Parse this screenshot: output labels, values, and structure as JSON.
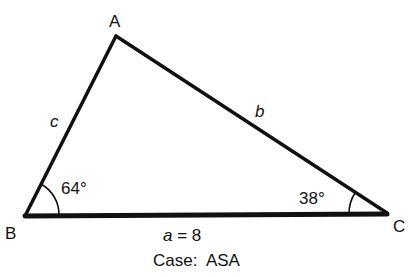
{
  "diagram": {
    "type": "triangle",
    "vertices": {
      "A": {
        "label": "A"
      },
      "B": {
        "label": "B"
      },
      "C": {
        "label": "C"
      }
    },
    "sides": {
      "a": {
        "label": "a = 8",
        "var": "a",
        "value": "8"
      },
      "b": {
        "label": "b"
      },
      "c": {
        "label": "c"
      }
    },
    "angles": {
      "B": {
        "label": "64°",
        "value": 64
      },
      "C": {
        "label": "38°",
        "value": 38
      }
    },
    "caption": "Case:  ASA",
    "colors": {
      "stroke": "#111111",
      "background": "#ffffff"
    }
  }
}
